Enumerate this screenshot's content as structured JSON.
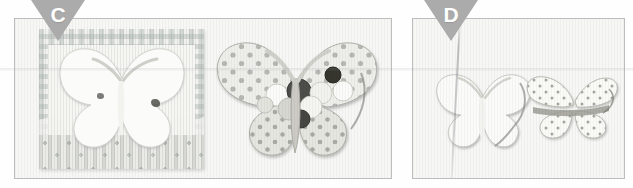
{
  "figure": {
    "type": "instructional-photo-sequence",
    "background_color": "#ffffff",
    "marker_color": "#ababab",
    "marker_letter_color": "#ffffff",
    "panel_border_color": "#bdbdbd",
    "panel_background_color": "#f7f7f5"
  },
  "panels": [
    {
      "id": "c",
      "label": "C",
      "caption": "",
      "objects": [
        {
          "name": "checkered-paper-sheet-with-butterfly-cutout",
          "description": "Gingham-check patterned paper square with a butterfly-shaped negative die-cut removed from the centre; a strip of dotted patterned paper runs along the lower edge.",
          "pattern": "gingham-check",
          "color": "#f1f1ee"
        },
        {
          "name": "polka-dot-butterfly-assembly",
          "description": "Layered butterfly die-cut in polka-dot patterned paper with overlapping round circle embellishments across the body, including dark and white dots.",
          "pattern": "polka-dot",
          "color": "#e6e6e2"
        }
      ]
    },
    {
      "id": "d",
      "label": "D",
      "caption": "",
      "objects": [
        {
          "name": "plain-white-butterfly",
          "description": "Plain cream butterfly die-cut lying flat on the background, a vertical crease line in the backing paper runs across it.",
          "pattern": "plain",
          "color": "#fbfbf9"
        },
        {
          "name": "star-print-butterfly",
          "description": "Butterfly die-cut in a small star / dot print paper, shown partially folded so the wings tilt away from the viewer.",
          "pattern": "star-print",
          "color": "#f4f4f1"
        }
      ]
    }
  ]
}
